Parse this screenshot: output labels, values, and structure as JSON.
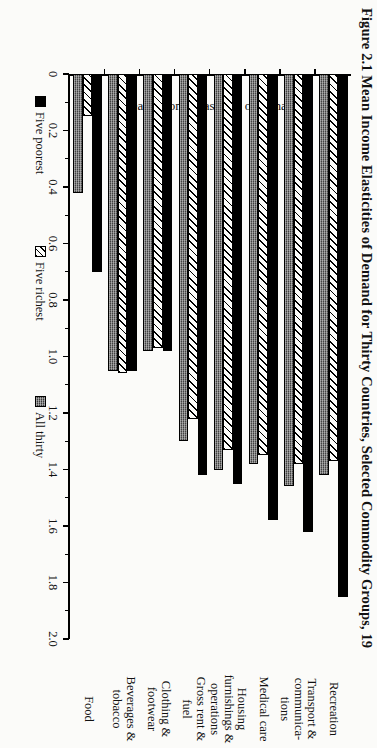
{
  "figure": {
    "title": "Figure 2.1 Mean Income Elasticities of Demand for Thirty Countries, Selected Commodity Groups, 19"
  },
  "chart_data": {
    "type": "bar",
    "orientation": "horizontal",
    "title": "Figure 2.1 Mean Income Elasticities of Demand for Thirty Countries, Selected Commodity Groups, 19",
    "xlabel": "",
    "ylabel": "Mean income elasticity of demand",
    "value_axis_label": "Mean income elasticity of demand",
    "ylim": [
      0,
      2.0
    ],
    "tick_labels": [
      "0",
      "0.2",
      "0.4",
      "0.6",
      "0.8",
      "1.0",
      "1.2",
      "1.4",
      "1.6",
      "1.8",
      "2.0"
    ],
    "tick_values": [
      0,
      0.2,
      0.4,
      0.6,
      0.8,
      1.0,
      1.2,
      1.4,
      1.6,
      1.8,
      2.0
    ],
    "grid": false,
    "legend_position": "bottom",
    "categories": [
      "Food",
      "Beverages &\ntobacco",
      "Clothing &\nfootwear",
      "Gross rent &\nfuel",
      "Housing\nfurnishings &\noperations",
      "Medical care",
      "Transport &\ncommunica-\ntions",
      "Recreation"
    ],
    "series": [
      {
        "name": "Five poorest",
        "pattern": "solid-black",
        "color": "#000000",
        "values": [
          0.7,
          1.05,
          0.98,
          1.42,
          1.45,
          1.58,
          1.62,
          1.85
        ]
      },
      {
        "name": "Five richest",
        "pattern": "diagonal-hatch",
        "color": "#ffffff",
        "values": [
          0.15,
          1.06,
          0.97,
          1.22,
          1.33,
          1.35,
          1.38,
          1.37
        ]
      },
      {
        "name": "All thirty",
        "pattern": "checkered-gray",
        "color": "#6e6e6e",
        "values": [
          0.42,
          1.05,
          0.98,
          1.3,
          1.4,
          1.38,
          1.46,
          1.42
        ]
      }
    ]
  },
  "legend": {
    "items": [
      {
        "label": "Five poorest",
        "key": "poorest"
      },
      {
        "label": "Five richest",
        "key": "richest"
      },
      {
        "label": "All thirty",
        "key": "all"
      }
    ]
  }
}
